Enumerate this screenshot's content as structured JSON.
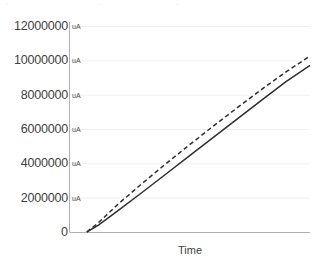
{
  "title_remnants": [
    {
      "text": "·",
      "left": 6
    },
    {
      "text": "··",
      "left": 96
    },
    {
      "text": "·",
      "left": 176
    }
  ],
  "chart_data": {
    "type": "line",
    "title": "",
    "xlabel": "Time",
    "ylabel": "",
    "y_unit": "uA",
    "ylim": [
      0,
      12000000
    ],
    "xlim": [
      0,
      100
    ],
    "grid": true,
    "legend": "none",
    "x_tick_labels": [],
    "y_tick_labels": [
      "0",
      "2000000",
      "4000000",
      "6000000",
      "8000000",
      "10000000",
      "12000000"
    ],
    "y_ticks": [
      0,
      2000000,
      4000000,
      6000000,
      8000000,
      10000000,
      12000000
    ],
    "series": [
      {
        "name": "series-solid",
        "style": "solid",
        "color": "#2f2f2f",
        "x": [
          7,
          12,
          20,
          30,
          40,
          50,
          60,
          70,
          80,
          90,
          100
        ],
        "values": [
          0,
          420000,
          1250000,
          2300000,
          3380000,
          4460000,
          5540000,
          6620000,
          7700000,
          8760000,
          9700000
        ]
      },
      {
        "name": "series-dashed",
        "style": "dashed",
        "color": "#2f2f2f",
        "x": [
          7,
          12,
          20,
          30,
          40,
          50,
          60,
          70,
          80,
          90,
          100
        ],
        "values": [
          0,
          560000,
          1620000,
          2820000,
          3980000,
          5100000,
          6200000,
          7270000,
          8320000,
          9330000,
          10250000
        ]
      }
    ]
  },
  "axis": {
    "y_axis_color": "#b0b0b0",
    "x_axis_color": "#b0b0b0",
    "grid_color": "#f0f0f0"
  }
}
